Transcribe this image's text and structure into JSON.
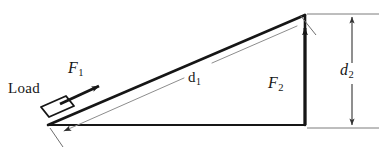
{
  "figure": {
    "type": "inclined-plane-force-diagram",
    "background_color": "#ffffff",
    "ink_color": "#161616",
    "thin_line_color": "#8d8d8d",
    "width": 385,
    "height": 153
  },
  "labels": {
    "load": "Load",
    "force_incline": "F",
    "force_incline_sub": "1",
    "force_vertical": "F",
    "force_vertical_sub": "2",
    "distance_incline": "d",
    "distance_incline_sub": "1",
    "distance_height": "d",
    "distance_height_sub": "2"
  },
  "geometry": {
    "apex": [
      305,
      15
    ],
    "base_left": [
      48,
      125
    ],
    "base_right": [
      305,
      125
    ],
    "incline_label_point": [
      196,
      78
    ],
    "height_dimension_x": 352,
    "height_dimension_top": 15,
    "height_dimension_bottom": 128
  },
  "elements": {
    "triangle": "right triangle: hypotenuse from base-left up to apex, vertical right leg, horizontal base",
    "load_block": "small rectangle resting on the incline near the lower left",
    "f1_arrow": "arrow pointing up-right along the incline surface",
    "f2_arrow": "arrow pointing up along the vertical right leg",
    "d1_dimension": "thin dimension line along the incline with arrowhead at lower left",
    "d2_dimension": "thin vertical dimension line at right with arrowheads at top and bottom"
  }
}
